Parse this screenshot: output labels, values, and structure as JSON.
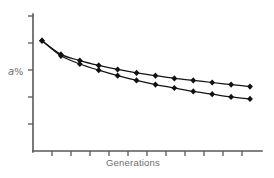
{
  "chart_data": {
    "type": "line",
    "title": "",
    "subtitle": "",
    "xlabel": "Generations",
    "ylabel": "a %",
    "xlabel_text": "Generations",
    "ylabel_italic": "a",
    "ylabel_unit": "%",
    "grid": false,
    "legend": "none",
    "xlim": [
      0,
      12
    ],
    "ylim": [
      0,
      100
    ],
    "x_tick_labels": [],
    "y_tick_labels": [],
    "x_tick_count": 12,
    "y_tick_count": 5,
    "x": [
      0,
      1,
      2,
      3,
      4,
      5,
      6,
      7,
      8,
      9,
      10,
      11
    ],
    "series": [
      {
        "name": "upper-curve",
        "values": [
          80.5,
          70.5,
          66.0,
          62.5,
          59.5,
          57.0,
          55.0,
          53.0,
          51.5,
          50.0,
          48.5,
          47.0
        ],
        "marker": "diamond",
        "color": "#111111"
      },
      {
        "name": "lower-curve",
        "values": [
          80.5,
          69.5,
          63.5,
          59.0,
          55.0,
          51.5,
          48.5,
          46.0,
          43.5,
          41.5,
          39.5,
          38.0
        ],
        "marker": "diamond",
        "color": "#111111"
      }
    ],
    "colors": {
      "axis": "#58585a",
      "line": "#111111",
      "marker": "#111111",
      "label": "#6c6c6e",
      "background": "#ffffff"
    }
  }
}
